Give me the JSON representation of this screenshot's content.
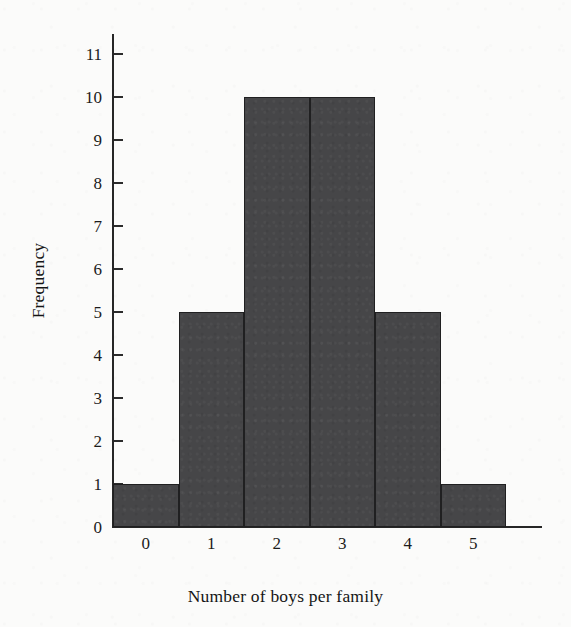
{
  "chart_data": {
    "type": "bar",
    "title": "",
    "subtitle": "",
    "xlabel": "Number of  boys per family",
    "ylabel": "Frequency",
    "categories": [
      "0",
      "1",
      "2",
      "3",
      "4",
      "5"
    ],
    "values": [
      1,
      5,
      10,
      10,
      5,
      1
    ],
    "series": [
      {
        "name": "Frequency",
        "values": [
          1,
          5,
          10,
          10,
          5,
          1
        ]
      }
    ],
    "xlim": [
      -0.5,
      5.5
    ],
    "ylim": [
      0,
      11
    ],
    "ytick_labels": [
      "0",
      "1",
      "2",
      "3",
      "4",
      "5",
      "6",
      "7",
      "8",
      "9",
      "10",
      "11"
    ],
    "ytick_values": [
      0,
      1,
      2,
      3,
      4,
      5,
      6,
      7,
      8,
      9,
      10,
      11
    ],
    "xtick_labels": [
      "0",
      "1",
      "2",
      "3",
      "4",
      "5"
    ],
    "grid": false,
    "legend": false,
    "legend_position": "none",
    "bar_fill_color": "#464648",
    "bar_edge_color": "#202021",
    "axis_color": "#262626",
    "background_color": "#fbfbfa",
    "text_color": "#1b1b1b",
    "annotations": []
  }
}
